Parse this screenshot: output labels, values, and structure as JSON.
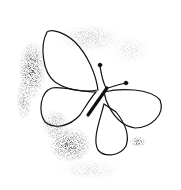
{
  "image": {
    "subject": "butterfly sketch with stippled spray texture",
    "width": 181,
    "height": 190,
    "colors": {
      "background": "#ffffff",
      "ink": "#111111"
    }
  }
}
